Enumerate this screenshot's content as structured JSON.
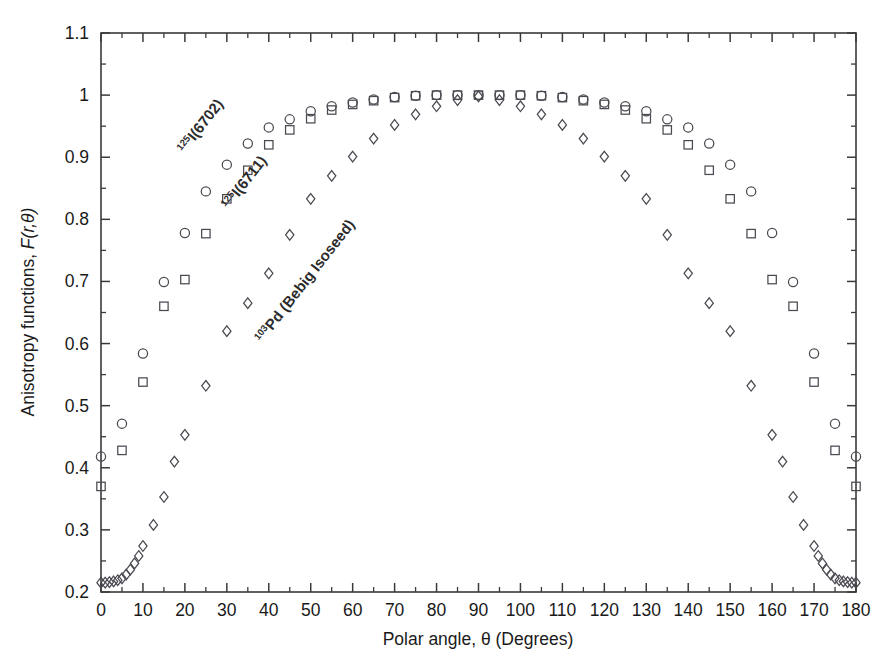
{
  "chart_data": {
    "type": "scatter",
    "title": "",
    "xlabel": "Polar angle, θ (Degrees)",
    "ylabel": "Anisotropy functions, F(r,θ)",
    "xlim": [
      0,
      180
    ],
    "ylim": [
      0.2,
      1.1
    ],
    "xticks": [
      0,
      10,
      20,
      30,
      40,
      50,
      60,
      70,
      80,
      90,
      100,
      110,
      120,
      130,
      140,
      150,
      160,
      170,
      180
    ],
    "xticklabels": [
      "0",
      "10",
      "20",
      "30",
      "40",
      "50",
      "60",
      "70",
      "80",
      "90",
      "100",
      "110",
      "120",
      "130",
      "140",
      "150",
      "160",
      "170",
      "180"
    ],
    "yticks": [
      0.2,
      0.3,
      0.4,
      0.5,
      0.6,
      0.7,
      0.8,
      0.9,
      1.0,
      1.1
    ],
    "yticklabels": [
      "0.2",
      "0.3",
      "0.4",
      "0.5",
      "0.6",
      "0.7",
      "0.8",
      "0.9",
      "1",
      "1.1"
    ],
    "minor_ticks": true,
    "grid": false,
    "legend": "none",
    "annotations": [
      {
        "id": "i125-6702",
        "sup": "125",
        "text": "I(6702)",
        "x": 20.0,
        "y": 0.905,
        "rotation": -52
      },
      {
        "id": "i125-6711",
        "sup": "125",
        "text": "I(6711)",
        "x": 30.5,
        "y": 0.815,
        "rotation": -52
      },
      {
        "id": "pd103-bebig",
        "sup": "103",
        "text": "Pd (Bebig Isoseed)",
        "x": 38.5,
        "y": 0.6,
        "rotation": -52
      }
    ],
    "series": [
      {
        "name": "125I(6702)",
        "marker": "circle",
        "x": [
          0,
          5,
          10,
          15,
          20,
          25,
          30,
          35,
          40,
          45,
          50,
          55,
          60,
          65,
          70,
          75,
          80,
          85,
          90,
          95,
          100,
          105,
          110,
          115,
          120,
          125,
          130,
          135,
          140,
          145,
          150,
          155,
          160,
          165,
          170,
          175,
          180
        ],
        "y": [
          0.418,
          0.471,
          0.584,
          0.699,
          0.778,
          0.845,
          0.888,
          0.922,
          0.948,
          0.961,
          0.974,
          0.982,
          0.988,
          0.993,
          0.997,
          0.999,
          1.0,
          1.0,
          1.0,
          1.0,
          1.0,
          0.999,
          0.997,
          0.993,
          0.988,
          0.982,
          0.974,
          0.961,
          0.948,
          0.922,
          0.888,
          0.845,
          0.778,
          0.699,
          0.584,
          0.471,
          0.418
        ]
      },
      {
        "name": "125I(6711)",
        "marker": "square",
        "x": [
          0,
          5,
          10,
          15,
          20,
          25,
          30,
          35,
          40,
          45,
          50,
          55,
          60,
          65,
          70,
          75,
          80,
          85,
          90,
          95,
          100,
          105,
          110,
          115,
          120,
          125,
          130,
          135,
          140,
          145,
          150,
          155,
          160,
          165,
          170,
          175,
          180
        ],
        "y": [
          0.37,
          0.428,
          0.538,
          0.66,
          0.703,
          0.777,
          0.833,
          0.879,
          0.92,
          0.944,
          0.962,
          0.976,
          0.985,
          0.991,
          0.996,
          0.999,
          1.0,
          1.0,
          1.0,
          1.0,
          1.0,
          0.999,
          0.996,
          0.991,
          0.985,
          0.976,
          0.962,
          0.944,
          0.92,
          0.879,
          0.833,
          0.777,
          0.703,
          0.66,
          0.538,
          0.428,
          0.37
        ]
      },
      {
        "name": "103Pd (Bebig Isoseed)",
        "marker": "diamond",
        "x": [
          0,
          1,
          2,
          3,
          4,
          5,
          6,
          7,
          8,
          9,
          10,
          12.5,
          15,
          17.5,
          20,
          25,
          30,
          35,
          40,
          45,
          50,
          55,
          60,
          65,
          70,
          75,
          80,
          85,
          90,
          95,
          100,
          105,
          110,
          115,
          120,
          125,
          130,
          135,
          140,
          145,
          150,
          155,
          160,
          162.5,
          165,
          167.5,
          170,
          171,
          172,
          173,
          174,
          175,
          176,
          177,
          178,
          179,
          180
        ],
        "y": [
          0.215,
          0.215,
          0.216,
          0.217,
          0.219,
          0.222,
          0.228,
          0.236,
          0.246,
          0.258,
          0.274,
          0.308,
          0.353,
          0.41,
          0.453,
          0.532,
          0.62,
          0.665,
          0.713,
          0.775,
          0.833,
          0.87,
          0.901,
          0.93,
          0.952,
          0.969,
          0.982,
          0.992,
          0.998,
          0.992,
          0.982,
          0.969,
          0.952,
          0.93,
          0.901,
          0.87,
          0.833,
          0.775,
          0.713,
          0.665,
          0.62,
          0.532,
          0.453,
          0.41,
          0.353,
          0.308,
          0.274,
          0.258,
          0.246,
          0.236,
          0.228,
          0.222,
          0.219,
          0.217,
          0.216,
          0.215,
          0.215
        ]
      }
    ]
  }
}
